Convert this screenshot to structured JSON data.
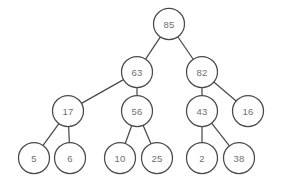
{
  "figure": {
    "background_color": "#ffffff",
    "stroke_color": "#4a4a4a",
    "label_color": "#6e6e6e",
    "node_fill": "#ffffff",
    "node_radius": 15.5,
    "width": 282,
    "height": 185
  },
  "chart_data": {
    "type": "diagram",
    "diagram_kind": "binary-tree",
    "title": "",
    "nodes": [
      {
        "id": "n85",
        "label": "85",
        "x": 169,
        "y": 24,
        "level": 0
      },
      {
        "id": "n63",
        "label": "63",
        "x": 137,
        "y": 72,
        "level": 1
      },
      {
        "id": "n82",
        "label": "82",
        "x": 202,
        "y": 72,
        "level": 1
      },
      {
        "id": "n17",
        "label": "17",
        "x": 68,
        "y": 111,
        "level": 2
      },
      {
        "id": "n56",
        "label": "56",
        "x": 137,
        "y": 111,
        "level": 2
      },
      {
        "id": "n43",
        "label": "43",
        "x": 202,
        "y": 111,
        "level": 2
      },
      {
        "id": "n16",
        "label": "16",
        "x": 248,
        "y": 111,
        "level": 2
      },
      {
        "id": "n5",
        "label": "5",
        "x": 34,
        "y": 158,
        "level": 3
      },
      {
        "id": "n6",
        "label": "6",
        "x": 70,
        "y": 158,
        "level": 3
      },
      {
        "id": "n10",
        "label": "10",
        "x": 120,
        "y": 158,
        "level": 3
      },
      {
        "id": "n25",
        "label": "25",
        "x": 157,
        "y": 158,
        "level": 3
      },
      {
        "id": "n2",
        "label": "2",
        "x": 202,
        "y": 158,
        "level": 3
      },
      {
        "id": "n38",
        "label": "38",
        "x": 239,
        "y": 158,
        "level": 3
      }
    ],
    "edges": [
      {
        "from": "n85",
        "to": "n63"
      },
      {
        "from": "n85",
        "to": "n82"
      },
      {
        "from": "n63",
        "to": "n17"
      },
      {
        "from": "n63",
        "to": "n56"
      },
      {
        "from": "n82",
        "to": "n43"
      },
      {
        "from": "n82",
        "to": "n16"
      },
      {
        "from": "n17",
        "to": "n5"
      },
      {
        "from": "n17",
        "to": "n6"
      },
      {
        "from": "n56",
        "to": "n10"
      },
      {
        "from": "n56",
        "to": "n25"
      },
      {
        "from": "n43",
        "to": "n2"
      },
      {
        "from": "n43",
        "to": "n38"
      }
    ]
  }
}
